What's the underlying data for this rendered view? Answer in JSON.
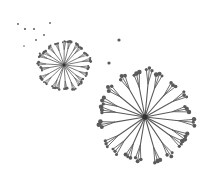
{
  "illustration": {
    "subject": "dandelion seed heads",
    "background": "#ffffff",
    "ink": "#5a5a5a",
    "heads": [
      {
        "name": "small-dandelion",
        "cx": 64,
        "cy": 65,
        "r": 24,
        "rays": 22,
        "stroke": 0.8,
        "seed": 1.1
      },
      {
        "name": "large-dandelion",
        "cx": 145,
        "cy": 117,
        "r": 44,
        "rays": 20,
        "stroke": 1.1,
        "seed": 1.8
      }
    ],
    "loose_seeds": [
      {
        "x": 18,
        "y": 24,
        "r": 0.9
      },
      {
        "x": 25,
        "y": 29,
        "r": 1.1
      },
      {
        "x": 34,
        "y": 29,
        "r": 1.0
      },
      {
        "x": 50,
        "y": 23,
        "r": 0.9
      },
      {
        "x": 44,
        "y": 35,
        "r": 0.9
      },
      {
        "x": 36,
        "y": 40,
        "r": 0.9
      },
      {
        "x": 24,
        "y": 46,
        "r": 0.8
      },
      {
        "x": 119,
        "y": 40,
        "r": 1.6
      },
      {
        "x": 109,
        "y": 63,
        "r": 1.6
      }
    ]
  }
}
